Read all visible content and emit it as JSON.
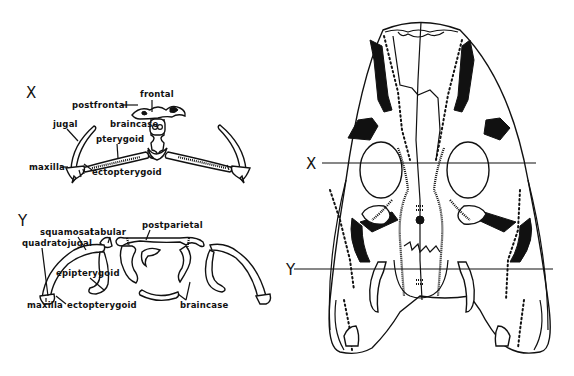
{
  "figure": {
    "sections": {
      "x": {
        "letter": "X",
        "labels": {
          "frontal": "frontal",
          "postfrontal": "postfrontal",
          "braincase": "braincase",
          "jugal": "jugal",
          "pterygoid": "pterygoid",
          "maxilla": "maxilla",
          "ectopterygoid": "ectopterygoid"
        }
      },
      "y": {
        "letter": "Y",
        "labels": {
          "squamosal": "squamosal",
          "tabular": "tabular",
          "postparietal": "postparietal",
          "quadratojugal": "quadratojugal",
          "epipterygoid": "epipterygoid",
          "maxilla": "maxilla",
          "ectopterygoid": "ectopterygoid",
          "braincase": "braincase"
        }
      }
    },
    "skull_view": {
      "section_lines": [
        {
          "letter": "X"
        },
        {
          "letter": "Y"
        }
      ]
    }
  }
}
